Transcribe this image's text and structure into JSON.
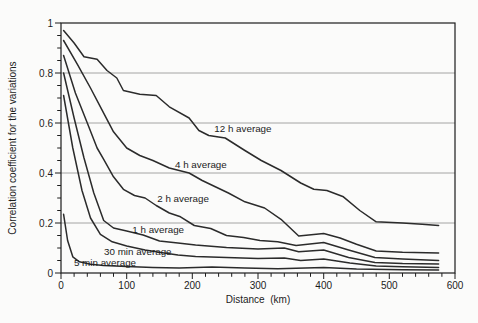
{
  "chart_data": {
    "type": "line",
    "title": "",
    "xlabel": "Distance  (km)",
    "ylabel": "Correlation coefficient for the variations",
    "xlim": [
      0,
      600
    ],
    "ylim": [
      0,
      1
    ],
    "x_ticks_major": [
      0,
      100,
      200,
      300,
      400,
      500,
      600
    ],
    "x_minor_step": 20,
    "y_ticks_major": [
      0,
      0.2,
      0.4,
      0.6,
      0.8,
      1
    ],
    "y_tick_labels": [
      "0",
      "0.2",
      "0.4",
      "0.6",
      "0.8",
      "1"
    ],
    "y_minor_step": 0.05,
    "grid_values": [
      0.2,
      0.4,
      0.6,
      0.8
    ],
    "grid": "horizontal-only",
    "legend_position": "inline-labels",
    "colors": {
      "line": "#2b2b2b",
      "grid": "#9a9a9a",
      "axis": "#1c1c1c",
      "text": "#1c1c1c",
      "background": "#fbfbfa"
    },
    "series": [
      {
        "name": "12 h average",
        "points": [
          [
            4,
            0.97
          ],
          [
            20,
            0.92
          ],
          [
            35,
            0.865
          ],
          [
            55,
            0.855
          ],
          [
            70,
            0.81
          ],
          [
            85,
            0.78
          ],
          [
            95,
            0.73
          ],
          [
            120,
            0.715
          ],
          [
            145,
            0.71
          ],
          [
            165,
            0.665
          ],
          [
            195,
            0.62
          ],
          [
            210,
            0.57
          ],
          [
            225,
            0.55
          ],
          [
            250,
            0.54
          ],
          [
            280,
            0.49
          ],
          [
            305,
            0.45
          ],
          [
            335,
            0.41
          ],
          [
            365,
            0.36
          ],
          [
            385,
            0.335
          ],
          [
            405,
            0.33
          ],
          [
            430,
            0.305
          ],
          [
            455,
            0.25
          ],
          [
            480,
            0.205
          ],
          [
            520,
            0.2
          ],
          [
            550,
            0.195
          ],
          [
            575,
            0.19
          ]
        ]
      },
      {
        "name": "4 h average",
        "points": [
          [
            4,
            0.93
          ],
          [
            25,
            0.835
          ],
          [
            45,
            0.74
          ],
          [
            62,
            0.655
          ],
          [
            80,
            0.565
          ],
          [
            100,
            0.5
          ],
          [
            120,
            0.47
          ],
          [
            140,
            0.45
          ],
          [
            165,
            0.42
          ],
          [
            195,
            0.4
          ],
          [
            215,
            0.37
          ],
          [
            235,
            0.345
          ],
          [
            255,
            0.32
          ],
          [
            280,
            0.285
          ],
          [
            310,
            0.26
          ],
          [
            335,
            0.215
          ],
          [
            362,
            0.148
          ],
          [
            400,
            0.158
          ],
          [
            425,
            0.14
          ],
          [
            450,
            0.115
          ],
          [
            480,
            0.088
          ],
          [
            520,
            0.083
          ],
          [
            575,
            0.08
          ]
        ]
      },
      {
        "name": "2 h average",
        "points": [
          [
            4,
            0.87
          ],
          [
            22,
            0.72
          ],
          [
            40,
            0.6
          ],
          [
            55,
            0.5
          ],
          [
            65,
            0.455
          ],
          [
            80,
            0.385
          ],
          [
            95,
            0.335
          ],
          [
            112,
            0.31
          ],
          [
            128,
            0.3
          ],
          [
            145,
            0.27
          ],
          [
            165,
            0.24
          ],
          [
            182,
            0.225
          ],
          [
            203,
            0.19
          ],
          [
            228,
            0.178
          ],
          [
            252,
            0.15
          ],
          [
            278,
            0.142
          ],
          [
            303,
            0.13
          ],
          [
            330,
            0.125
          ],
          [
            358,
            0.11
          ],
          [
            400,
            0.122
          ],
          [
            438,
            0.092
          ],
          [
            478,
            0.062
          ],
          [
            520,
            0.056
          ],
          [
            575,
            0.05
          ]
        ]
      },
      {
        "name": "1 h average",
        "points": [
          [
            4,
            0.8
          ],
          [
            20,
            0.62
          ],
          [
            35,
            0.46
          ],
          [
            50,
            0.32
          ],
          [
            65,
            0.21
          ],
          [
            80,
            0.18
          ],
          [
            100,
            0.168
          ],
          [
            125,
            0.152
          ],
          [
            150,
            0.128
          ],
          [
            178,
            0.12
          ],
          [
            205,
            0.112
          ],
          [
            252,
            0.102
          ],
          [
            300,
            0.096
          ],
          [
            340,
            0.1
          ],
          [
            362,
            0.085
          ],
          [
            400,
            0.092
          ],
          [
            438,
            0.062
          ],
          [
            478,
            0.042
          ],
          [
            520,
            0.038
          ],
          [
            575,
            0.036
          ]
        ]
      },
      {
        "name": "30 min average",
        "points": [
          [
            4,
            0.71
          ],
          [
            18,
            0.5
          ],
          [
            32,
            0.33
          ],
          [
            45,
            0.22
          ],
          [
            60,
            0.155
          ],
          [
            78,
            0.125
          ],
          [
            100,
            0.108
          ],
          [
            128,
            0.092
          ],
          [
            152,
            0.082
          ],
          [
            178,
            0.072
          ],
          [
            205,
            0.066
          ],
          [
            252,
            0.062
          ],
          [
            300,
            0.058
          ],
          [
            340,
            0.06
          ],
          [
            365,
            0.05
          ],
          [
            400,
            0.056
          ],
          [
            440,
            0.04
          ],
          [
            480,
            0.028
          ],
          [
            520,
            0.025
          ],
          [
            575,
            0.022
          ]
        ]
      },
      {
        "name": "5 min average",
        "points": [
          [
            4,
            0.235
          ],
          [
            10,
            0.13
          ],
          [
            18,
            0.065
          ],
          [
            28,
            0.045
          ],
          [
            45,
            0.035
          ],
          [
            65,
            0.03
          ],
          [
            100,
            0.026
          ],
          [
            140,
            0.022
          ],
          [
            180,
            0.02
          ],
          [
            230,
            0.024
          ],
          [
            280,
            0.02
          ],
          [
            330,
            0.017
          ],
          [
            400,
            0.022
          ],
          [
            450,
            0.016
          ],
          [
            520,
            0.013
          ],
          [
            575,
            0.012
          ]
        ]
      }
    ],
    "labels": [
      {
        "text": "12 h average",
        "x": 277,
        "y": 0.578
      },
      {
        "text": "4 h average",
        "x": 213,
        "y": 0.432
      },
      {
        "text": "2 h average",
        "x": 186,
        "y": 0.297
      },
      {
        "text": "1 h average",
        "x": 148,
        "y": 0.172
      },
      {
        "text": "30 min average",
        "x": 117,
        "y": 0.086
      },
      {
        "text": "5 min average",
        "x": 67,
        "y": 0.042
      }
    ]
  }
}
